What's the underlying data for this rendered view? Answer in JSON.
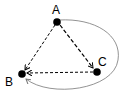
{
  "diagram": {
    "nodes": [
      {
        "id": "A",
        "label": "A",
        "x": 57,
        "y": 22,
        "label_x": 56,
        "label_y": 12
      },
      {
        "id": "B",
        "label": "B",
        "x": 22,
        "y": 74,
        "label_x": 10,
        "label_y": 84
      },
      {
        "id": "C",
        "label": "C",
        "x": 97,
        "y": 72,
        "label_x": 101,
        "label_y": 65
      }
    ],
    "edges": [
      {
        "from": "A",
        "to": "B",
        "style": "dashed",
        "directed": true
      },
      {
        "from": "A",
        "to": "C",
        "style": "dashed",
        "directed": true
      },
      {
        "from": "C",
        "to": "B",
        "style": "dashed",
        "directed": true
      },
      {
        "from": "A",
        "to": "B",
        "style": "solid-curved",
        "directed": true,
        "via": "right-around-C"
      }
    ],
    "colors": {
      "node": "#000000",
      "dashed_edge": "#000000",
      "curved_edge": "#777777"
    }
  }
}
